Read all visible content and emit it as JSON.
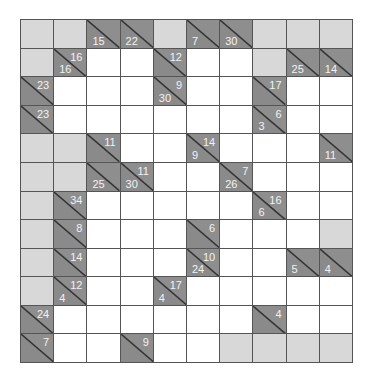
{
  "puzzle": {
    "type": "kakuro",
    "cols": 10,
    "rows": 12,
    "colors": {
      "clue_bg": "#8e8e8e",
      "blank_bg": "#d8d8d8",
      "entry_bg": "#ffffff",
      "grid_line": "#555555",
      "clue_text": "#f2f2f2"
    },
    "grid": [
      [
        {
          "t": "L"
        },
        {
          "t": "L"
        },
        {
          "t": "C",
          "d": "15"
        },
        {
          "t": "C",
          "d": "22"
        },
        {
          "t": "L"
        },
        {
          "t": "C",
          "d": "7"
        },
        {
          "t": "C",
          "d": "30"
        },
        {
          "t": "L"
        },
        {
          "t": "L"
        },
        {
          "t": "L"
        }
      ],
      [
        {
          "t": "L"
        },
        {
          "t": "C",
          "r": "16",
          "d": "16"
        },
        {
          "t": "W"
        },
        {
          "t": "W"
        },
        {
          "t": "C",
          "r": "12"
        },
        {
          "t": "W"
        },
        {
          "t": "W"
        },
        {
          "t": "L"
        },
        {
          "t": "C",
          "d": "25"
        },
        {
          "t": "C",
          "d": "14"
        }
      ],
      [
        {
          "t": "C",
          "r": "23"
        },
        {
          "t": "W"
        },
        {
          "t": "W"
        },
        {
          "t": "W"
        },
        {
          "t": "C",
          "r": "9",
          "d": "30"
        },
        {
          "t": "W"
        },
        {
          "t": "W"
        },
        {
          "t": "C",
          "r": "17"
        },
        {
          "t": "W"
        },
        {
          "t": "W"
        }
      ],
      [
        {
          "t": "C",
          "r": "23"
        },
        {
          "t": "W"
        },
        {
          "t": "W"
        },
        {
          "t": "W"
        },
        {
          "t": "W"
        },
        {
          "t": "W"
        },
        {
          "t": "W"
        },
        {
          "t": "C",
          "r": "6",
          "d": "3"
        },
        {
          "t": "W"
        },
        {
          "t": "W"
        }
      ],
      [
        {
          "t": "L"
        },
        {
          "t": "L"
        },
        {
          "t": "C",
          "r": "11"
        },
        {
          "t": "W"
        },
        {
          "t": "W"
        },
        {
          "t": "C",
          "r": "14",
          "d": "9"
        },
        {
          "t": "W"
        },
        {
          "t": "W"
        },
        {
          "t": "W"
        },
        {
          "t": "C",
          "d": "11"
        }
      ],
      [
        {
          "t": "L"
        },
        {
          "t": "L"
        },
        {
          "t": "C",
          "d": "25"
        },
        {
          "t": "C",
          "r": "11",
          "d": "30"
        },
        {
          "t": "W"
        },
        {
          "t": "W"
        },
        {
          "t": "C",
          "r": "7",
          "d": "26"
        },
        {
          "t": "W"
        },
        {
          "t": "W"
        },
        {
          "t": "W"
        }
      ],
      [
        {
          "t": "L"
        },
        {
          "t": "C",
          "r": "34"
        },
        {
          "t": "W"
        },
        {
          "t": "W"
        },
        {
          "t": "W"
        },
        {
          "t": "W"
        },
        {
          "t": "W"
        },
        {
          "t": "C",
          "r": "16",
          "d": "6"
        },
        {
          "t": "W"
        },
        {
          "t": "W"
        }
      ],
      [
        {
          "t": "L"
        },
        {
          "t": "C",
          "r": "8"
        },
        {
          "t": "W"
        },
        {
          "t": "W"
        },
        {
          "t": "W"
        },
        {
          "t": "C",
          "r": "6"
        },
        {
          "t": "W"
        },
        {
          "t": "W"
        },
        {
          "t": "W"
        },
        {
          "t": "L"
        }
      ],
      [
        {
          "t": "L"
        },
        {
          "t": "C",
          "r": "14"
        },
        {
          "t": "W"
        },
        {
          "t": "W"
        },
        {
          "t": "W"
        },
        {
          "t": "C",
          "r": "10",
          "d": "24"
        },
        {
          "t": "W"
        },
        {
          "t": "W"
        },
        {
          "t": "C",
          "d": "5"
        },
        {
          "t": "C",
          "d": "4"
        }
      ],
      [
        {
          "t": "L"
        },
        {
          "t": "C",
          "r": "12",
          "d": "4"
        },
        {
          "t": "W"
        },
        {
          "t": "W"
        },
        {
          "t": "C",
          "r": "17",
          "d": "4"
        },
        {
          "t": "W"
        },
        {
          "t": "W"
        },
        {
          "t": "W"
        },
        {
          "t": "W"
        },
        {
          "t": "W"
        }
      ],
      [
        {
          "t": "C",
          "r": "24"
        },
        {
          "t": "W"
        },
        {
          "t": "W"
        },
        {
          "t": "W"
        },
        {
          "t": "W"
        },
        {
          "t": "W"
        },
        {
          "t": "W"
        },
        {
          "t": "C",
          "r": "4"
        },
        {
          "t": "W"
        },
        {
          "t": "W"
        }
      ],
      [
        {
          "t": "C",
          "r": "7"
        },
        {
          "t": "W"
        },
        {
          "t": "W"
        },
        {
          "t": "C",
          "r": "9"
        },
        {
          "t": "W"
        },
        {
          "t": "W"
        },
        {
          "t": "L"
        },
        {
          "t": "L"
        },
        {
          "t": "L"
        },
        {
          "t": "L"
        }
      ]
    ]
  }
}
